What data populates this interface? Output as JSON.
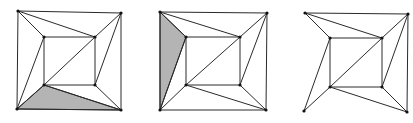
{
  "figure": {
    "colors": {
      "edge": "#2a2a2a",
      "shaded_face": "#b4b4b4",
      "vertex": "#111111",
      "background": "#ffffff"
    },
    "panels": [
      {
        "id": "panel-1",
        "vertices": {
          "o_tl": [
            18,
            11
          ],
          "o_tr": [
            121,
            13
          ],
          "o_bl": [
            17,
            109
          ],
          "o_br": [
            121,
            110
          ],
          "i_tl": [
            44,
            37
          ],
          "i_tr": [
            95,
            37
          ],
          "i_bl": [
            44,
            85
          ],
          "i_br": [
            95,
            85
          ]
        },
        "edges": [
          [
            "o_tl",
            "o_tr"
          ],
          [
            "o_tl",
            "o_bl"
          ],
          [
            "o_tr",
            "o_br"
          ],
          [
            "o_bl",
            "o_br"
          ],
          [
            "i_tl",
            "i_tr"
          ],
          [
            "i_tl",
            "i_bl"
          ],
          [
            "i_tr",
            "i_br"
          ],
          [
            "i_bl",
            "i_br"
          ],
          [
            "i_bl",
            "i_tr"
          ],
          [
            "o_tl",
            "i_tl"
          ],
          [
            "o_tl",
            "i_tr"
          ],
          [
            "o_tr",
            "i_tr"
          ],
          [
            "o_tr",
            "i_br"
          ],
          [
            "o_bl",
            "i_tl"
          ],
          [
            "o_bl",
            "i_bl"
          ],
          [
            "o_br",
            "i_br"
          ],
          [
            "o_br",
            "i_bl"
          ]
        ],
        "shaded_face": [
          "o_bl",
          "i_bl",
          "o_br"
        ]
      },
      {
        "id": "panel-2",
        "vertices": {
          "o_tl": [
            160,
            12
          ],
          "o_tr": [
            267,
            13
          ],
          "o_bl": [
            160,
            110
          ],
          "o_br": [
            266,
            110
          ],
          "i_tl": [
            186,
            37
          ],
          "i_tr": [
            240,
            37
          ],
          "i_bl": [
            186,
            85
          ],
          "i_br": [
            240,
            85
          ]
        },
        "edges": [
          [
            "o_tl",
            "o_tr"
          ],
          [
            "o_tl",
            "o_bl"
          ],
          [
            "o_tr",
            "o_br"
          ],
          [
            "o_bl",
            "o_br"
          ],
          [
            "i_tl",
            "i_tr"
          ],
          [
            "i_tl",
            "i_bl"
          ],
          [
            "i_tr",
            "i_br"
          ],
          [
            "i_bl",
            "i_br"
          ],
          [
            "i_bl",
            "i_tr"
          ],
          [
            "o_tl",
            "i_tl"
          ],
          [
            "o_tl",
            "i_tr"
          ],
          [
            "o_tr",
            "i_tr"
          ],
          [
            "o_tr",
            "i_br"
          ],
          [
            "o_bl",
            "i_tl"
          ],
          [
            "o_bl",
            "i_bl"
          ],
          [
            "o_br",
            "i_br"
          ],
          [
            "o_br",
            "i_bl"
          ]
        ],
        "shaded_face": [
          "o_tl",
          "i_tl",
          "o_bl"
        ]
      },
      {
        "id": "panel-3",
        "vertices": {
          "o_tl": [
            305,
            13
          ],
          "o_tr": [
            408,
            14
          ],
          "o_bl": [
            304,
            111
          ],
          "o_br": [
            407,
            112
          ],
          "i_tl": [
            330,
            38
          ],
          "i_tr": [
            382,
            38
          ],
          "i_bl": [
            330,
            87
          ],
          "i_br": [
            382,
            87
          ]
        },
        "edges": [
          [
            "o_tl",
            "o_tr"
          ],
          [
            "o_tr",
            "o_br"
          ],
          [
            "i_tl",
            "i_tr"
          ],
          [
            "i_tl",
            "i_bl"
          ],
          [
            "i_tr",
            "i_br"
          ],
          [
            "i_bl",
            "i_br"
          ],
          [
            "i_bl",
            "i_tr"
          ],
          [
            "o_tl",
            "i_tl"
          ],
          [
            "o_tl",
            "i_tr"
          ],
          [
            "o_tr",
            "i_tr"
          ],
          [
            "o_tr",
            "i_br"
          ],
          [
            "o_bl",
            "i_tl"
          ],
          [
            "o_bl",
            "i_bl"
          ],
          [
            "o_br",
            "i_br"
          ],
          [
            "o_br",
            "i_bl"
          ]
        ],
        "shaded_face": null
      }
    ]
  }
}
